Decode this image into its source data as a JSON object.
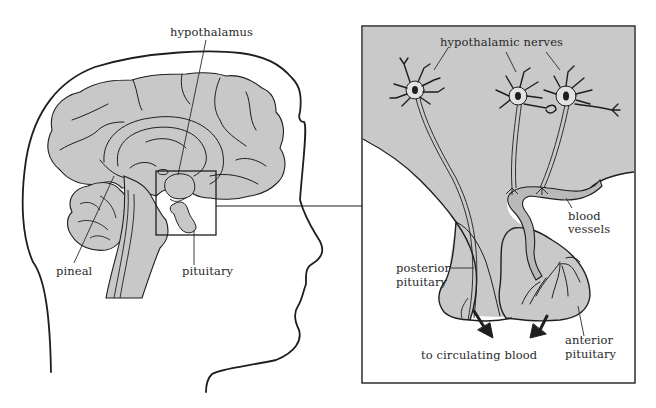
{
  "figure": {
    "left_panel": {
      "title": "Sagittal section of human head and brain",
      "labels": {
        "hypothalamus": "hypothalamus",
        "pineal": "pineal",
        "pituitary": "pituitary"
      }
    },
    "right_panel": {
      "title": "Enlarged view of hypothalamus and pituitary",
      "labels": {
        "hypothalamic_nerves": "hypothalamic nerves",
        "blood_vessels_line1": "blood",
        "blood_vessels_line2": "vessels",
        "posterior_pituitary_line1": "posterior",
        "posterior_pituitary_line2": "pituitary",
        "anterior_pituitary_line1": "anterior",
        "anterior_pituitary_line2": "pituitary",
        "to_circulating_blood": "to circulating blood"
      }
    },
    "colors": {
      "tissue_fill": "#c8c8c8",
      "panel_fill": "#c9c9c9",
      "outline": "#1e1e1e",
      "background": "#ffffff"
    }
  }
}
